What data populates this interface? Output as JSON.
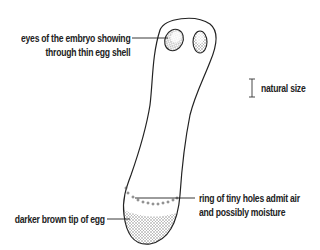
{
  "diagram": {
    "labels": {
      "eyes_line1": "eyes of the embryo showing",
      "eyes_line2": "through thin egg shell",
      "scale": "natural size",
      "ring_line1": "ring of tiny holes admit air",
      "ring_line2": "and possibly moisture",
      "tip": "darker brown tip of egg"
    },
    "colors": {
      "outline": "#222222",
      "shading": "#9a9a9a",
      "text": "#222222"
    }
  }
}
